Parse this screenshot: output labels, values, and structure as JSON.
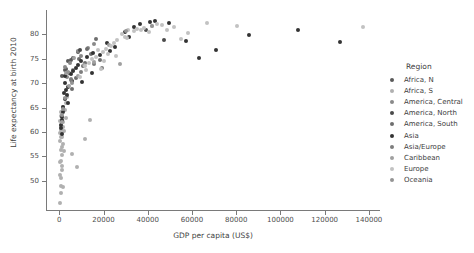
{
  "chart_data": {
    "type": "scatter",
    "title": "",
    "xlabel": "GDP per capita (US$)",
    "ylabel": "Life expectancy at birth 2010",
    "xlim": [
      -6000,
      145000
    ],
    "ylim": [
      44,
      85
    ],
    "xticks": [
      0,
      20000,
      40000,
      60000,
      80000,
      100000,
      120000,
      140000
    ],
    "xtick_labels": [
      "0",
      "20000",
      "40000",
      "60000",
      "80000",
      "100000",
      "120000",
      "140000"
    ],
    "yticks": [
      50,
      55,
      60,
      65,
      70,
      75,
      80
    ],
    "ytick_labels": [
      "50",
      "55",
      "60",
      "65",
      "70",
      "75",
      "80"
    ],
    "grid": false,
    "legend_position": "right",
    "legend_title": "Region",
    "series": [
      {
        "name": "Africa, N",
        "color": "#595959",
        "points": [
          [
            3800,
            74.5
          ],
          [
            3100,
            73.0
          ],
          [
            5200,
            74.8
          ],
          [
            1200,
            71.5
          ],
          [
            8500,
            76.3
          ],
          [
            2400,
            72.6
          ],
          [
            6400,
            75.1
          ]
        ]
      },
      {
        "name": "Africa, S",
        "color": "#b0b0b0",
        "points": [
          [
            700,
            47.5
          ],
          [
            900,
            49.0
          ],
          [
            600,
            50.5
          ],
          [
            1400,
            52.3
          ],
          [
            500,
            53.8
          ],
          [
            1100,
            55.2
          ],
          [
            800,
            56.4
          ],
          [
            1600,
            57.5
          ],
          [
            450,
            58.2
          ],
          [
            1300,
            59.0
          ],
          [
            2100,
            60.1
          ],
          [
            700,
            61.3
          ],
          [
            1900,
            62.0
          ],
          [
            1000,
            63.2
          ],
          [
            600,
            54.0
          ],
          [
            2600,
            64.5
          ],
          [
            350,
            51.2
          ],
          [
            1500,
            48.8
          ],
          [
            900,
            58.9
          ],
          [
            3200,
            62.8
          ],
          [
            2200,
            56.0
          ],
          [
            400,
            59.8
          ],
          [
            1800,
            61.0
          ],
          [
            1150,
            53.0
          ],
          [
            5600,
            55.5
          ],
          [
            7800,
            52.8
          ],
          [
            11500,
            58.5
          ],
          [
            650,
            64.0
          ],
          [
            1750,
            65.1
          ],
          [
            13800,
            62.5
          ],
          [
            2900,
            66.0
          ],
          [
            480,
            45.5
          ],
          [
            3600,
            67.2
          ],
          [
            950,
            60.5
          ],
          [
            1250,
            57.0
          ],
          [
            520,
            62.2
          ]
        ]
      },
      {
        "name": "America, Central",
        "color": "#8a8a8a",
        "points": [
          [
            8300,
            76.5
          ],
          [
            4900,
            74.1
          ],
          [
            6200,
            72.8
          ],
          [
            2700,
            73.4
          ],
          [
            13200,
            77.2
          ],
          [
            3400,
            71.2
          ],
          [
            9600,
            75.6
          ],
          [
            5100,
            70.8
          ],
          [
            15500,
            78.0
          ]
        ]
      },
      {
        "name": "America, North",
        "color": "#4a4a4a",
        "points": [
          [
            47500,
            78.8
          ],
          [
            39200,
            81.0
          ],
          [
            9200,
            76.7
          ]
        ]
      },
      {
        "name": "America, South",
        "color": "#6e6e6e",
        "points": [
          [
            10800,
            73.5
          ],
          [
            14200,
            76.0
          ],
          [
            11500,
            74.2
          ],
          [
            4600,
            72.1
          ],
          [
            8900,
            75.0
          ],
          [
            16800,
            79.0
          ],
          [
            7400,
            71.0
          ],
          [
            12600,
            77.1
          ],
          [
            5800,
            68.8
          ],
          [
            18200,
            74.8
          ]
        ]
      },
      {
        "name": "Asia",
        "color": "#333333",
        "points": [
          [
            7400,
            73.2
          ],
          [
            3200,
            68.5
          ],
          [
            1600,
            65.2
          ],
          [
            31500,
            79.5
          ],
          [
            43200,
            82.8
          ],
          [
            29800,
            80.4
          ],
          [
            2400,
            70.1
          ],
          [
            5200,
            71.8
          ],
          [
            36500,
            82.1
          ],
          [
            9800,
            74.6
          ],
          [
            1100,
            62.5
          ],
          [
            2800,
            66.8
          ],
          [
            15200,
            76.2
          ],
          [
            49500,
            82.3
          ],
          [
            6100,
            72.4
          ],
          [
            21500,
            78.2
          ],
          [
            86000,
            79.8
          ],
          [
            57500,
            78.6
          ],
          [
            71000,
            76.9
          ],
          [
            4100,
            69.2
          ],
          [
            1900,
            64.0
          ],
          [
            950,
            60.8
          ],
          [
            3700,
            67.5
          ],
          [
            25200,
            77.5
          ],
          [
            12400,
            75.3
          ],
          [
            108000,
            81.0
          ],
          [
            1400,
            63.0
          ],
          [
            8600,
            73.8
          ],
          [
            2100,
            68.0
          ],
          [
            34000,
            81.5
          ],
          [
            18500,
            75.8
          ],
          [
            63000,
            75.2
          ],
          [
            5600,
            70.5
          ],
          [
            2600,
            71.4
          ],
          [
            1300,
            59.5
          ],
          [
            700,
            61.5
          ],
          [
            23000,
            76.5
          ],
          [
            41000,
            82.5
          ],
          [
            127000,
            78.5
          ],
          [
            14800,
            72.0
          ],
          [
            3900,
            66.0
          ],
          [
            10500,
            70.3
          ]
        ]
      },
      {
        "name": "Asia/Europe",
        "color": "#7d7d7d",
        "points": [
          [
            15800,
            74.0
          ],
          [
            9600,
            72.3
          ],
          [
            5400,
            70.6
          ],
          [
            19500,
            73.2
          ]
        ]
      },
      {
        "name": "Caribbean",
        "color": "#a0a0a0",
        "points": [
          [
            11200,
            73.8
          ],
          [
            6800,
            75.2
          ],
          [
            1200,
            62.0
          ],
          [
            8400,
            71.5
          ],
          [
            22500,
            77.8
          ],
          [
            4200,
            69.5
          ],
          [
            15600,
            74.4
          ],
          [
            2900,
            72.0
          ],
          [
            27500,
            74.0
          ]
        ]
      },
      {
        "name": "Europe",
        "color": "#c2c2c2",
        "points": [
          [
            35200,
            81.2
          ],
          [
            28400,
            80.0
          ],
          [
            42100,
            81.8
          ],
          [
            19800,
            76.4
          ],
          [
            24600,
            78.3
          ],
          [
            31000,
            80.8
          ],
          [
            46500,
            82.0
          ],
          [
            13500,
            74.2
          ],
          [
            38500,
            81.4
          ],
          [
            52000,
            81.6
          ],
          [
            21200,
            77.0
          ],
          [
            16400,
            75.4
          ],
          [
            29500,
            79.4
          ],
          [
            58000,
            80.2
          ],
          [
            33600,
            80.6
          ],
          [
            26000,
            78.8
          ],
          [
            11800,
            73.6
          ],
          [
            44000,
            82.2
          ],
          [
            80500,
            81.8
          ],
          [
            17600,
            76.8
          ],
          [
            23400,
            77.6
          ],
          [
            36800,
            81.0
          ],
          [
            137500,
            81.5
          ],
          [
            14900,
            75.0
          ],
          [
            48500,
            80.9
          ],
          [
            20400,
            74.6
          ],
          [
            30500,
            79.2
          ],
          [
            25800,
            75.6
          ],
          [
            12200,
            72.8
          ],
          [
            40500,
            80.4
          ],
          [
            18900,
            73.0
          ],
          [
            67000,
            82.4
          ],
          [
            9400,
            71.2
          ],
          [
            22000,
            76.0
          ],
          [
            55000,
            79.0
          ]
        ]
      },
      {
        "name": "Oceania",
        "color": "#949494",
        "points": [
          [
            41800,
            81.8
          ],
          [
            30200,
            80.6
          ],
          [
            2600,
            67.0
          ],
          [
            1400,
            63.5
          ],
          [
            3800,
            72.2
          ],
          [
            5900,
            70.0
          ],
          [
            1800,
            64.8
          ]
        ]
      }
    ]
  }
}
